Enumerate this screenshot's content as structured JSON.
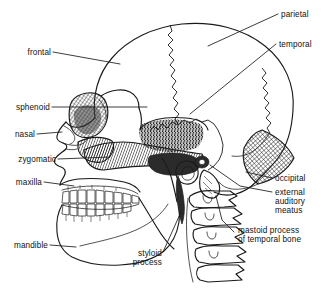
{
  "figure": {
    "type": "anatomical-line-diagram",
    "background_color": "#ffffff",
    "line_color": "#1a1a1a",
    "text_color": "#111111"
  },
  "labels": {
    "frontal": "frontal",
    "parietal": "parietal",
    "temporal": "temporal",
    "sphenoid": "sphenoid",
    "nasal": "nasal",
    "zygomatic": "zygomatic",
    "maxilla": "maxilla",
    "mandible": "mandible",
    "occipital": "occipital",
    "external_1": "external",
    "external_2": "auditory",
    "external_3": "meatus",
    "mastoid_1": "mastoid process",
    "mastoid_2": "of temporal bone",
    "styloid_1": "styloid",
    "styloid_2": "process"
  },
  "structures": [
    {
      "name": "frontal bone",
      "label": "frontal"
    },
    {
      "name": "parietal bone",
      "label": "parietal"
    },
    {
      "name": "temporal bone",
      "label": "temporal"
    },
    {
      "name": "sphenoid bone",
      "label": "sphenoid"
    },
    {
      "name": "nasal bone",
      "label": "nasal"
    },
    {
      "name": "zygomatic bone",
      "label": "zygomatic"
    },
    {
      "name": "maxilla",
      "label": "maxilla"
    },
    {
      "name": "mandible",
      "label": "mandible"
    },
    {
      "name": "occipital bone",
      "label": "occipital"
    },
    {
      "name": "external auditory meatus",
      "label": "external auditory meatus"
    },
    {
      "name": "mastoid process of temporal bone",
      "label": "mastoid process of temporal bone"
    },
    {
      "name": "styloid process",
      "label": "styloid process"
    }
  ],
  "vertebrae_count": 4
}
